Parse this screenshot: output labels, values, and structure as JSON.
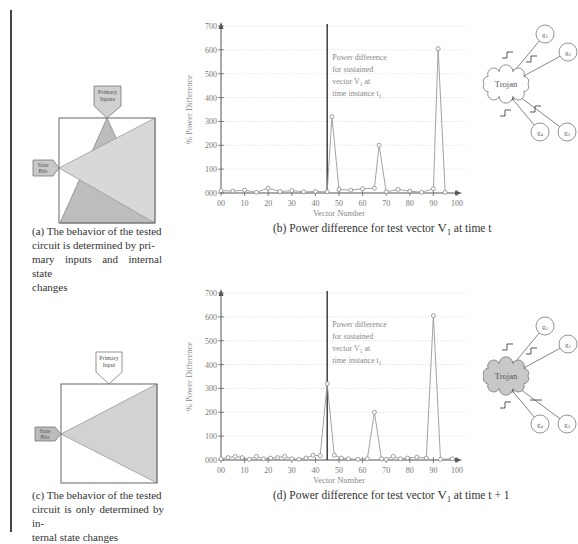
{
  "figure": {
    "panel_a": {
      "label": "(a)",
      "caption": "(a) The behavior of the tested circuit is determined by primary inputs and internal state changes",
      "caption_lines": [
        "(a) The behavior of the tested",
        "circuit is determined by pri-",
        "mary inputs and internal state",
        "changes"
      ],
      "primary_input_label": [
        "Primary",
        "Inputs"
      ],
      "state_bits_label": [
        "State",
        "Bits"
      ]
    },
    "panel_b": {
      "caption_prefix": "(b) Power difference for test vector ",
      "caption_vector": "V",
      "caption_sub": "1",
      "caption_suffix": " at time t",
      "annotation": [
        "Power difference",
        "for sustained",
        "vector V",
        "time instance t"
      ],
      "annotation_line3_sub": "1",
      "annotation_line3_tail": " at",
      "annotation_line4_sub": "1"
    },
    "panel_c": {
      "label": "(c)",
      "caption_lines": [
        "(c) The behavior of the tested",
        "circuit is only determined by in-",
        "ternal state changes"
      ],
      "primary_input_label": [
        "Primary",
        "Input"
      ],
      "state_bits_label": [
        "State",
        "Bits"
      ]
    },
    "panel_d": {
      "caption_prefix": "(d) Power difference for test vector ",
      "caption_vector": "V",
      "caption_sub": "1",
      "caption_suffix": " at time t + 1",
      "annotation": [
        "Power difference",
        "for sustained",
        "vector V",
        "time instance t"
      ],
      "annotation_line3_sub": "1",
      "annotation_line3_tail": " at",
      "annotation_line4_sub": "1"
    },
    "trojan_top": {
      "label": "Trojan",
      "gates": [
        "g1",
        "g2",
        "g3",
        "g4"
      ],
      "shaded": false
    },
    "trojan_bottom": {
      "label": "Trojan",
      "gates": [
        "g1",
        "g2",
        "g3",
        "g4"
      ],
      "shaded": true
    }
  },
  "chart_data": [
    {
      "type": "line",
      "title": "(b) Power difference for test vector V1 at time t",
      "xlabel": "Vector Number",
      "ylabel": "% Power Difference",
      "xlim": [
        0,
        100
      ],
      "ylim": [
        0,
        700
      ],
      "xticks": [
        "00",
        "10",
        "20",
        "30",
        "40",
        "50",
        "60",
        "70",
        "80",
        "90",
        "100"
      ],
      "yticks": [
        "000",
        "100",
        "200",
        "300",
        "400",
        "500",
        "600",
        "700"
      ],
      "grid": true,
      "marker": "circle",
      "vertical_marker_x": 45,
      "annotation": "Power difference for sustained vector V1 at time instance t1",
      "x": [
        0,
        5,
        10,
        15,
        20,
        25,
        30,
        35,
        40,
        45,
        47,
        50,
        55,
        60,
        65,
        67,
        70,
        75,
        80,
        85,
        90,
        92,
        95
      ],
      "y": [
        10,
        8,
        12,
        3,
        20,
        6,
        10,
        5,
        6,
        5,
        320,
        15,
        12,
        18,
        20,
        200,
        5,
        15,
        8,
        3,
        18,
        605,
        3
      ]
    },
    {
      "type": "line",
      "title": "(d) Power difference for test vector V1 at time t + 1",
      "xlabel": "Vector Number",
      "ylabel": "% Power Difference",
      "xlim": [
        0,
        100
      ],
      "ylim": [
        0,
        700
      ],
      "xticks": [
        "00",
        "10",
        "20",
        "30",
        "40",
        "50",
        "60",
        "70",
        "80",
        "90",
        "100"
      ],
      "yticks": [
        "000",
        "100",
        "200",
        "300",
        "400",
        "500",
        "600",
        "700"
      ],
      "grid": true,
      "marker": "circle",
      "vertical_marker_x": 45,
      "annotation": "Power difference for sustained vector V1 at time instance t1",
      "x": [
        0,
        3,
        6,
        9,
        12,
        15,
        18,
        21,
        24,
        27,
        30,
        33,
        36,
        39,
        42,
        45,
        48,
        51,
        54,
        58,
        62,
        65,
        68,
        70,
        73,
        76,
        79,
        83,
        87,
        90,
        93,
        98
      ],
      "y": [
        5,
        10,
        15,
        10,
        3,
        15,
        5,
        8,
        10,
        15,
        5,
        3,
        8,
        20,
        18,
        320,
        20,
        8,
        5,
        3,
        5,
        200,
        5,
        3,
        15,
        5,
        8,
        12,
        8,
        605,
        3,
        5
      ]
    }
  ]
}
